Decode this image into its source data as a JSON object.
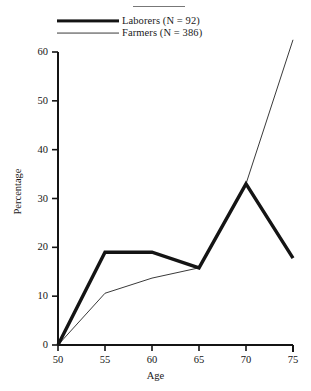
{
  "figure": {
    "has_top_rule": true
  },
  "legend": {
    "position": "top-left",
    "entries": [
      {
        "label": "Laborers (N = 92)",
        "style": "thick",
        "color": "#141414"
      },
      {
        "label": "Farmers (N = 386)",
        "style": "thin",
        "color": "#3a3a3a"
      }
    ]
  },
  "axes": {
    "x_title": "Age",
    "y_title": "Percentage",
    "x_ticks": [
      "50",
      "55",
      "60",
      "65",
      "70",
      "75"
    ],
    "y_ticks": [
      "0",
      "10",
      "20",
      "30",
      "40",
      "50",
      "60"
    ]
  },
  "chart_data": {
    "type": "line",
    "title": "",
    "subtitle": "",
    "xlabel": "Age",
    "ylabel": "Percentage",
    "x": [
      50,
      55,
      60,
      65,
      70,
      75
    ],
    "xlim": [
      50,
      75
    ],
    "ylim": [
      0,
      60
    ],
    "xticks": [
      50,
      55,
      60,
      65,
      70,
      75
    ],
    "yticks": [
      0,
      10,
      20,
      30,
      40,
      50,
      60
    ],
    "grid": false,
    "legend_position": "top-left",
    "series": [
      {
        "name": "Laborers (N = 92)",
        "values": [
          0,
          19,
          19,
          15.8,
          33,
          17.8
        ],
        "linewidth": "thick",
        "color": "#141414"
      },
      {
        "name": "Farmers (N = 386)",
        "values": [
          0,
          10.6,
          13.7,
          15.8,
          33,
          62.5
        ],
        "linewidth": "thin",
        "color": "#3a3a3a",
        "note": "final segment extends above the plot frame (clipped at top)"
      }
    ],
    "annotations": []
  }
}
